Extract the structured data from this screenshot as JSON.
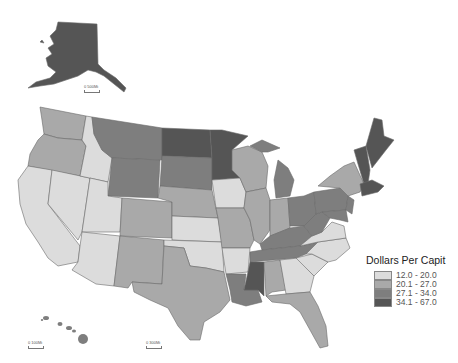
{
  "legend": {
    "title": "Dollars Per Capit",
    "classes": [
      {
        "label": "12.0 - 20.0",
        "color": "#dcdcdc"
      },
      {
        "label": "20.1 - 27.0",
        "color": "#a9a9a9"
      },
      {
        "label": "27.1 - 34.0",
        "color": "#7e7e7e"
      },
      {
        "label": "34.1 - 67.0",
        "color": "#555555"
      }
    ]
  },
  "scalebars": {
    "alaska": "0   500Mi",
    "hawaii": "0   100Mi",
    "conus": "0   300Mi"
  },
  "states": {
    "WA": 2,
    "OR": 2,
    "CA": 1,
    "NV": 1,
    "ID": 1,
    "MT": 3,
    "WY": 3,
    "UT": 1,
    "AZ": 1,
    "CO": 2,
    "NM": 2,
    "ND": 4,
    "SD": 3,
    "NE": 2,
    "KS": 1,
    "OK": 1,
    "TX": 2,
    "MN": 4,
    "IA": 1,
    "MO": 2,
    "AR": 1,
    "LA": 3,
    "WI": 2,
    "IL": 2,
    "MI": 3,
    "IN": 2,
    "OH": 3,
    "KY": 3,
    "TN": 3,
    "MS": 4,
    "AL": 2,
    "GA": 1,
    "FL": 2,
    "SC": 1,
    "NC": 1,
    "VA": 1,
    "WV": 3,
    "PA": 3,
    "NY": 2,
    "ME": 4,
    "NH": 4,
    "VT": 4,
    "MA": 4,
    "CT": 4,
    "RI": 4,
    "NJ": 3,
    "DE": 3,
    "MD": 3,
    "AK": 4,
    "HI": 3
  }
}
